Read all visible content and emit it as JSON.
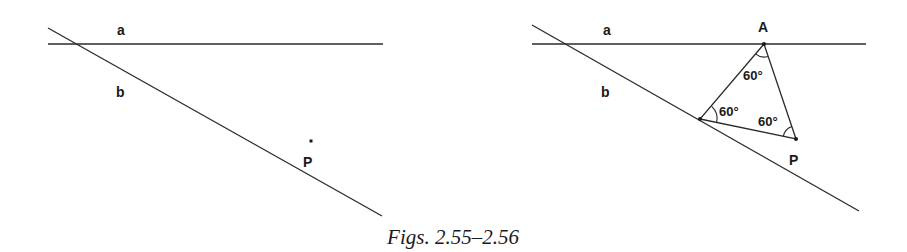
{
  "caption": "Figs. 2.55–2.56",
  "figure_left": {
    "id": "2.55",
    "line_a_label": "a",
    "line_b_label": "b",
    "point_p_label": "P"
  },
  "figure_right": {
    "id": "2.56",
    "line_a_label": "a",
    "line_b_label": "b",
    "point_a_label": "A",
    "point_p_label": "P",
    "angle_at_a": "60°",
    "angle_at_b": "60°",
    "angle_at_p": "60°"
  },
  "colors": {
    "ink": "#1a1a1a",
    "background": "#ffffff"
  }
}
